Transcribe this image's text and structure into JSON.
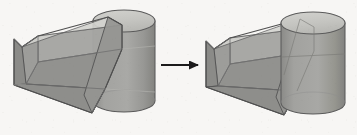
{
  "figure": {
    "description": "Left panel shows a tilted open-top transparent box intersecting a cylinder with the box wall passing in front of the cylinder; right panel shows the same pair after the transformation, with the cylinder drawn in front of the box.",
    "background_color": "#f7f6f4",
    "panel_count": 2
  },
  "palette": {
    "background": "#f7f6f4",
    "outline": "#4a4a4a",
    "outline_soft": "#8d8d8d",
    "box_face_front": "#949491",
    "box_face_inner_left": "#8e8e8b",
    "box_face_inner_back": "#a0a09d",
    "box_face_rim": "#c9c9c5",
    "box_face_top_rim": "#d5d5d1",
    "cylinder_body": "#9b9b98",
    "cylinder_body_shade": "#8a8a87",
    "cylinder_top": "#c2c2be",
    "cylinder_top_highlight": "#cecec9",
    "arrow": "#1b1b1b"
  },
  "panels": [
    {
      "id": "panel-left",
      "name": "before-state",
      "label": "Left scene: box occluding cylinder",
      "objects": [
        {
          "name": "cylinder",
          "shape": "cylinder",
          "depth_order": "behind-box-wall",
          "top_ellipse": {
            "cx": 124,
            "cy": 21,
            "rx": 31,
            "ry": 11
          },
          "bottom_ellipse": {
            "cx": 124,
            "cy": 101,
            "rx": 31,
            "ry": 11
          },
          "height": 80
        },
        {
          "name": "open-box",
          "shape": "rectangular-open-box",
          "depth_order": "front",
          "tilted": true,
          "open_face": "top"
        }
      ]
    },
    {
      "id": "panel-right",
      "name": "after-state",
      "label": "Right scene: cylinder occluding box",
      "objects": [
        {
          "name": "open-box",
          "shape": "rectangular-open-box",
          "depth_order": "behind",
          "tilted": true,
          "open_face": "top"
        },
        {
          "name": "cylinder",
          "shape": "cylinder",
          "depth_order": "front",
          "top_ellipse": {
            "cx": 313,
            "cy": 23,
            "rx": 32,
            "ry": 11
          },
          "bottom_ellipse": {
            "cx": 313,
            "cy": 103,
            "rx": 32,
            "ry": 11
          },
          "height": 80
        }
      ]
    }
  ],
  "arrow": {
    "name": "transition-arrow",
    "direction": "right",
    "label": "",
    "x_start": 161,
    "x_end": 203,
    "y": 65,
    "color": "#1b1b1b",
    "stroke_width": 2.2,
    "head_length": 9,
    "head_width": 8
  }
}
